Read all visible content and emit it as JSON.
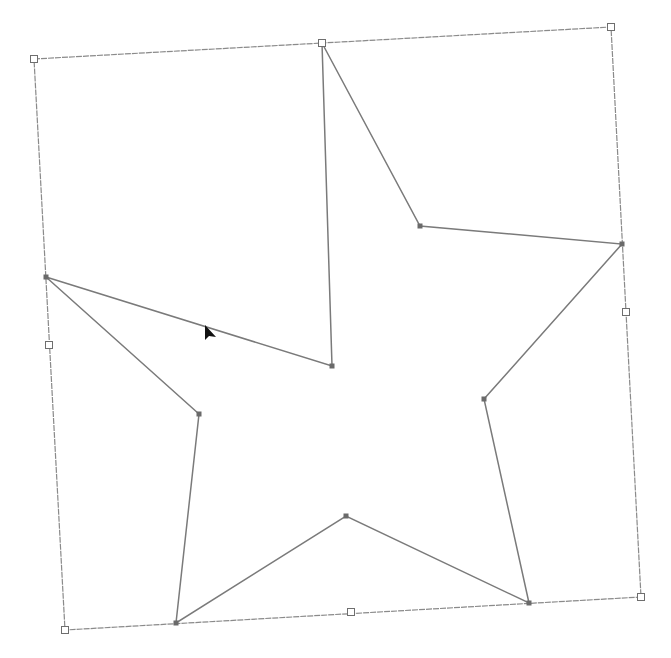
{
  "canvas": {
    "width": 671,
    "height": 658,
    "background": "#ffffff"
  },
  "colors": {
    "bounding_box_stroke": "#8a8a8a",
    "star_stroke": "#7a7a7a",
    "handle_fill": "#ffffff",
    "handle_stroke": "#6e6e6e",
    "anchor_fill": "#6a6a6a",
    "cursor_fill": "#111111"
  },
  "bounding_box": {
    "corners": [
      {
        "name": "top-left",
        "x": 34,
        "y": 59
      },
      {
        "name": "top-right",
        "x": 611,
        "y": 27
      },
      {
        "name": "bottom-right",
        "x": 641,
        "y": 597
      },
      {
        "name": "bottom-left",
        "x": 65,
        "y": 630
      }
    ],
    "edge_handles": [
      {
        "name": "top-middle",
        "x": 322,
        "y": 43
      },
      {
        "name": "right-middle",
        "x": 626,
        "y": 312
      },
      {
        "name": "bottom-middle",
        "x": 351,
        "y": 612
      },
      {
        "name": "left-middle",
        "x": 49,
        "y": 345
      }
    ]
  },
  "star": {
    "vertices": [
      {
        "x": 322,
        "y": 43
      },
      {
        "x": 420,
        "y": 226
      },
      {
        "x": 622,
        "y": 244
      },
      {
        "x": 484,
        "y": 399
      },
      {
        "x": 529,
        "y": 603
      },
      {
        "x": 346,
        "y": 516
      },
      {
        "x": 176,
        "y": 623
      },
      {
        "x": 199,
        "y": 414
      },
      {
        "x": 46,
        "y": 277
      },
      {
        "x": 332,
        "y": 366
      }
    ]
  },
  "cursor": {
    "icon": "arrow-pointer-icon",
    "x": 205,
    "y": 325
  }
}
